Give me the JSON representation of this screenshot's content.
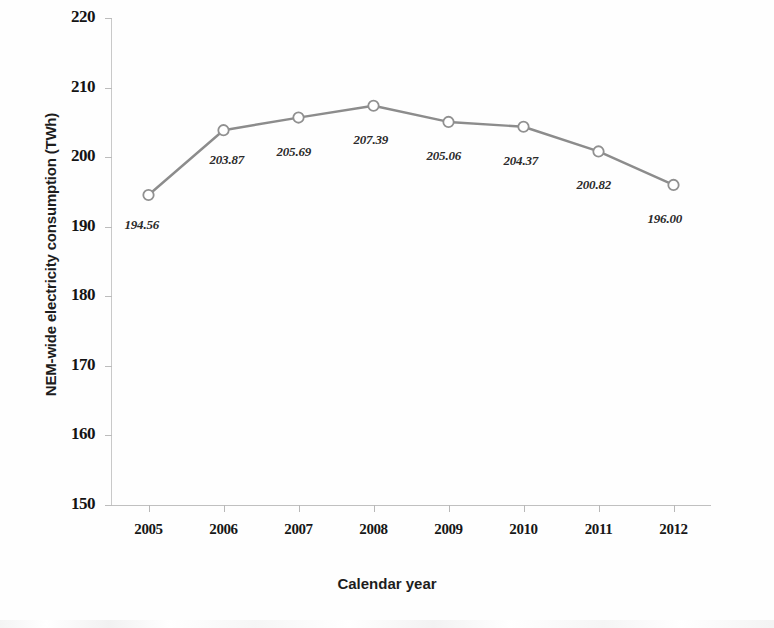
{
  "chart_data": {
    "type": "line",
    "title": "",
    "xlabel": "Calendar year",
    "ylabel": "NEM-wide electricity consumption (TWh)",
    "categories": [
      "2005",
      "2006",
      "2007",
      "2008",
      "2009",
      "2010",
      "2011",
      "2012"
    ],
    "values": [
      194.56,
      203.87,
      205.69,
      207.39,
      205.06,
      204.37,
      200.82,
      196.0
    ],
    "point_labels": [
      "194.56",
      "203.87",
      "205.69",
      "207.39",
      "205.06",
      "204.37",
      "200.82",
      "196.00"
    ],
    "ylim": [
      150,
      220
    ],
    "ytick_labels": [
      "220",
      "210",
      "200",
      "190",
      "180",
      "170",
      "160",
      "150"
    ],
    "ytick_values": [
      220,
      210,
      200,
      190,
      180,
      170,
      160,
      150
    ],
    "grid": false,
    "legend": "none",
    "series_color": "#8c8c8c",
    "marker": "open-circle",
    "marker_fill": "#ffffff",
    "marker_edge": "#909090",
    "axis_color": "#c0c0c0",
    "text_color": "#1a1a1a"
  }
}
